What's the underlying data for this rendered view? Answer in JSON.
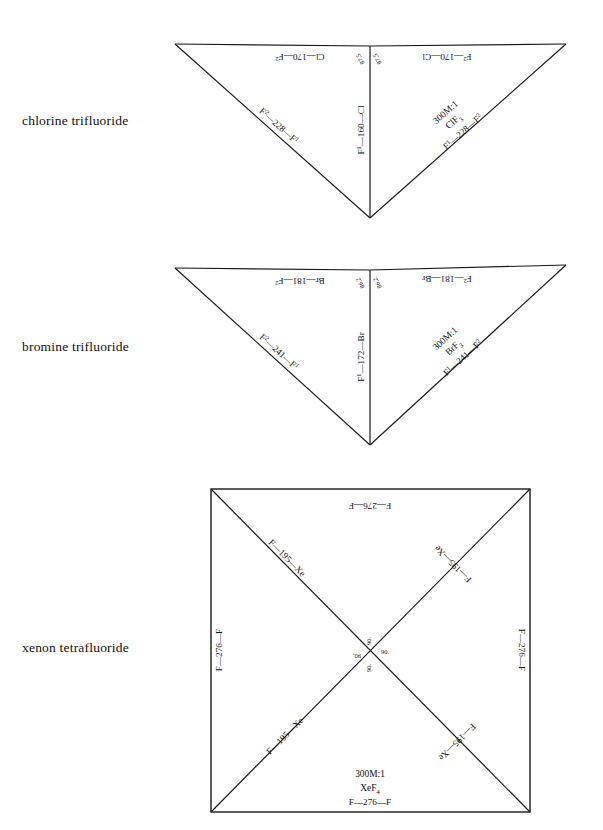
{
  "document": {
    "type": "molecular-geometry-figure",
    "background": "#ffffff",
    "ink": "#1a1a1a"
  },
  "molecules": [
    {
      "id": "clf3",
      "name": "chlorine trifluoride",
      "formula": "ClF",
      "formula_sub": "3",
      "scale": "300M:1",
      "shape": "T-shaped",
      "caption_lines": [
        "300M:1",
        "ClF3",
        "F1—228—F2"
      ],
      "labels": {
        "top_left_edge": "Cl—170—F",
        "top_left_edge_sup": "2",
        "top_right_edge": "F",
        "top_right_edge_sup": "2",
        "top_right_edge_rest": "—170—Cl",
        "vertical_bond": "F",
        "vertical_bond_sup": "1",
        "vertical_bond_rest": "—160—Cl",
        "left_diagonal": "F",
        "left_diagonal_sup": "2",
        "left_diagonal_rest": "—228—F",
        "left_diagonal_sup2": "1",
        "right_diagonal": "F",
        "right_diagonal_sup": "1",
        "right_diagonal_rest": "—228—F",
        "right_diagonal_sup2": "2",
        "angle_left": "87.5",
        "angle_right": "87.5"
      }
    },
    {
      "id": "brf3",
      "name": "bromine trifluoride",
      "formula": "BrF",
      "formula_sub": "3",
      "scale": "300M:1",
      "shape": "T-shaped",
      "caption_lines": [
        "300M:1",
        "BrF3",
        "F1—241—F2"
      ],
      "labels": {
        "top_left_edge": "Br—181—F",
        "top_left_edge_sup": "2",
        "top_right_edge": "F",
        "top_right_edge_sup": "2",
        "top_right_edge_rest": "—181—Br",
        "vertical_bond": "F",
        "vertical_bond_sup": "1",
        "vertical_bond_rest": "—172—Br",
        "left_diagonal": "F",
        "left_diagonal_sup": "2",
        "left_diagonal_rest": "—241—F",
        "left_diagonal_sup2": "1",
        "right_diagonal": "F",
        "right_diagonal_sup": "1",
        "right_diagonal_rest": "—241—F",
        "right_diagonal_sup2": "2",
        "angle_left": "86.2",
        "angle_right": "86.2"
      }
    },
    {
      "id": "xef4",
      "name": "xenon tetrafluoride",
      "formula": "XeF",
      "formula_sub": "4",
      "scale": "300M:1",
      "shape": "square-planar",
      "caption_lines": [
        "300M:1",
        "XeF4",
        "F—276—F"
      ],
      "labels": {
        "top_edge": "F—276—F",
        "bottom_edge": "F—276—F",
        "left_edge": "F—276—F",
        "right_edge": "F—276—F",
        "diag_upper_left": "F—195—Xe",
        "diag_upper_right": "F—195—Xe",
        "diag_lower_left": "F—195—Xe",
        "diag_lower_right": "F—195—Xe",
        "angle_top": "90.",
        "angle_right": "90.",
        "angle_bottom": "90.",
        "angle_left": "90."
      }
    }
  ],
  "geometry": {
    "clf3": {
      "left_apex": [
        175,
        44
      ],
      "right_apex": [
        566,
        44
      ],
      "center_top": [
        370,
        46
      ],
      "bottom_vertex": [
        370,
        218
      ]
    },
    "brf3": {
      "left_apex": [
        175,
        268
      ],
      "right_apex": [
        566,
        265
      ],
      "center_top": [
        370,
        270
      ],
      "bottom_vertex": [
        370,
        445
      ]
    },
    "xef4": {
      "top_left": [
        211,
        489
      ],
      "top_right": [
        530,
        489
      ],
      "bottom_left": [
        211,
        812
      ],
      "bottom_right": [
        530,
        812
      ]
    }
  }
}
